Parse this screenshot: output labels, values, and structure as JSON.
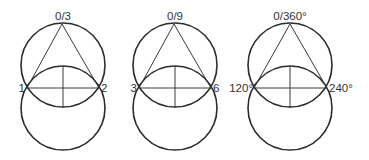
{
  "diagrams": [
    {
      "id": "cycle-3",
      "cx": 63,
      "top_label": "0/3",
      "left_label": "1",
      "right_label": "2"
    },
    {
      "id": "cycle-9",
      "cx": 175,
      "top_label": "0/9",
      "left_label": "3",
      "right_label": "6"
    },
    {
      "id": "cycle-360",
      "cx": 290,
      "top_label": "0/360°",
      "left_label": "120°",
      "right_label": "240°"
    }
  ],
  "colors": {
    "stroke": "#2b2b2b",
    "text": "#333333",
    "background": "#ffffff"
  }
}
